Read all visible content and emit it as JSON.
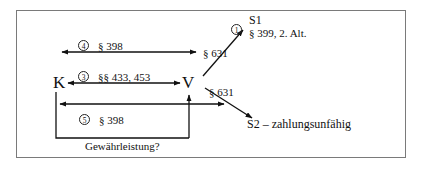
{
  "figure": {
    "type": "legal-relationship-diagram",
    "border_color": "#7a7a7a",
    "background": "#ffffff",
    "text_color": "#111111",
    "nodes": {
      "k": "K",
      "v": "V",
      "s1": "S1",
      "s2": "S2 – zahlungsunfähig"
    },
    "labels": {
      "step1_marker": "1",
      "step3_marker": "3",
      "step4_marker": "4",
      "step5_marker": "5",
      "s1_norm": "§ 399, 2. Alt.",
      "top_arrow_norm": "§ 398",
      "middle_arrow_norm": "§§ 433, 453",
      "bottom_arrow_norm": "§ 398",
      "v_s1_norm": "§ 631",
      "v_s2_norm": "§ 631",
      "bracket_question": "Gewährleistung?"
    }
  }
}
